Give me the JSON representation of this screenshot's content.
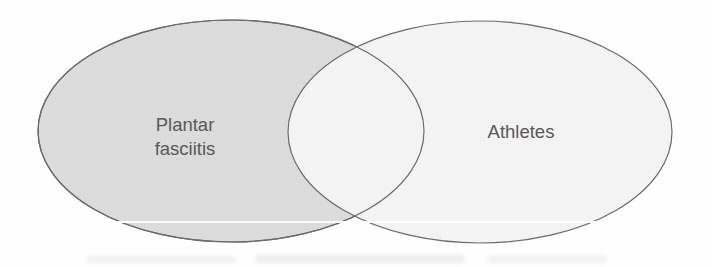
{
  "figure": {
    "type": "venn-diagram",
    "set_count": 2,
    "background_color": "#ffffff",
    "width": 712,
    "height": 267
  },
  "sets": {
    "left": {
      "label_line_1": "Plantar",
      "label_line_2": "fasciitis",
      "label_full": "Plantar fasciitis",
      "fill_color": "#dcdcdc",
      "stroke_color": "#6b6b6b",
      "center_x": 231,
      "center_y": 131,
      "radius_x": 193,
      "radius_y": 111
    },
    "right": {
      "label_line_1": "Athletes",
      "label_full": "Athletes",
      "fill_color": "#f4f4f4",
      "stroke_color": "#6b6b6b",
      "center_x": 480,
      "center_y": 132,
      "radius_x": 192,
      "radius_y": 111
    },
    "overlap": {
      "fill_color": "#f4f4f4",
      "label": ""
    }
  },
  "labels": {
    "left_x": 185,
    "left_y_line_1": 131,
    "left_y_line_2": 155,
    "right_x": 521,
    "right_y": 138,
    "text_color": "#595959"
  },
  "artifacts": {
    "scanline": "horizontal-white-scan-band",
    "bleed": "faint-gray-bleedthrough-bottom"
  }
}
